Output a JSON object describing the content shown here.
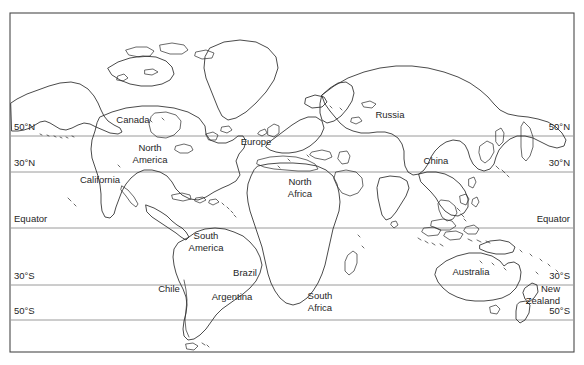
{
  "figure": {
    "kind": "world-map",
    "width": 584,
    "height": 365,
    "background_color": "#ffffff",
    "coastline_color": "#2b2b2b",
    "latitude_line_color": "#9a9a9a",
    "frame_color": "#4a4a4a",
    "text_color": "#1f1f1f"
  },
  "frame": {
    "left": 10,
    "top": 13,
    "right": 574,
    "bottom": 352
  },
  "latitudes": [
    {
      "id": "lat-50n",
      "label_left": "50°N",
      "label_right": "50°N",
      "y": 136,
      "label_y": 130
    },
    {
      "id": "lat-30n",
      "label_left": "30°N",
      "label_right": "30°N",
      "y": 172,
      "label_y": 166
    },
    {
      "id": "lat-equator",
      "label_left": "Equator",
      "label_right": "Equator",
      "y": 228,
      "label_y": 222
    },
    {
      "id": "lat-30s",
      "label_left": "30°S",
      "label_right": "30°S",
      "y": 285,
      "label_y": 279
    },
    {
      "id": "lat-50s",
      "label_left": "50°S",
      "label_right": "50°S",
      "y": 320,
      "label_y": 314
    }
  ],
  "latitude_label_x": {
    "left": 14,
    "right": 570
  },
  "regions": [
    {
      "id": "canada",
      "label": "Canada",
      "x": 133,
      "y": 123,
      "lines": [
        "Canada"
      ]
    },
    {
      "id": "north-america",
      "label": "North America",
      "x": 150,
      "y": 151,
      "lines": [
        "North",
        "America"
      ]
    },
    {
      "id": "california",
      "label": "California",
      "x": 100,
      "y": 183,
      "lines": [
        "California"
      ]
    },
    {
      "id": "south-america",
      "label": "South America",
      "x": 206,
      "y": 239,
      "lines": [
        "South",
        "America"
      ]
    },
    {
      "id": "chile",
      "label": "Chile",
      "x": 169,
      "y": 292,
      "lines": [
        "Chile"
      ]
    },
    {
      "id": "argentina",
      "label": "Argentina",
      "x": 232,
      "y": 300,
      "lines": [
        "Argentina"
      ]
    },
    {
      "id": "brazil",
      "label": "Brazil",
      "x": 245,
      "y": 276,
      "lines": [
        "Brazil"
      ]
    },
    {
      "id": "europe",
      "label": "Europe",
      "x": 256,
      "y": 145,
      "lines": [
        "Europe"
      ]
    },
    {
      "id": "north-africa",
      "label": "North Africa",
      "x": 300,
      "y": 185,
      "lines": [
        "North",
        "Africa"
      ]
    },
    {
      "id": "south-africa",
      "label": "South Africa",
      "x": 320,
      "y": 299,
      "lines": [
        "South",
        "Africa"
      ]
    },
    {
      "id": "russia",
      "label": "Russia",
      "x": 390,
      "y": 118,
      "lines": [
        "Russia"
      ]
    },
    {
      "id": "china",
      "label": "China",
      "x": 436,
      "y": 164,
      "lines": [
        "China"
      ]
    },
    {
      "id": "australia",
      "label": "Australia",
      "x": 471,
      "y": 275,
      "lines": [
        "Australia"
      ]
    },
    {
      "id": "new-zealand",
      "label": "New Zealand",
      "x": 546,
      "y": 292,
      "lines": [
        "New",
        "Zealand"
      ]
    }
  ]
}
